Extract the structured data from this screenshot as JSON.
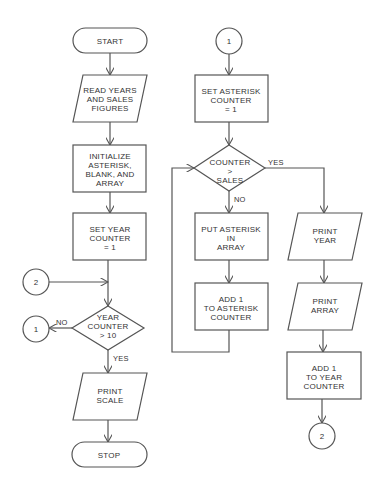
{
  "diagram": {
    "type": "flowchart",
    "colors": {
      "stroke": "#555555",
      "text": "#333333",
      "background": "#ffffff"
    },
    "nodes": {
      "start": {
        "shape": "terminal",
        "lines": [
          "START"
        ]
      },
      "read": {
        "shape": "input-output",
        "lines": [
          "READ YEARS",
          "AND SALES",
          "FIGURES"
        ]
      },
      "init": {
        "shape": "process",
        "lines": [
          "INITIALIZE",
          "ASTERISK,",
          "BLANK, AND",
          "ARRAY"
        ]
      },
      "set_year": {
        "shape": "process",
        "lines": [
          "SET YEAR",
          "COUNTER",
          "= 1"
        ]
      },
      "conn2_in": {
        "shape": "connector",
        "label": "2"
      },
      "year_decision": {
        "shape": "decision",
        "lines": [
          "YEAR",
          "COUNTER",
          "> 10"
        ]
      },
      "conn1_out": {
        "shape": "connector",
        "label": "1"
      },
      "print_scale": {
        "shape": "input-output",
        "lines": [
          "PRINT",
          "SCALE"
        ]
      },
      "stop": {
        "shape": "terminal",
        "lines": [
          "STOP"
        ]
      },
      "conn1_in": {
        "shape": "connector",
        "label": "1"
      },
      "set_asterisk": {
        "shape": "process",
        "lines": [
          "SET ASTERISK",
          "COUNTER",
          "= 1"
        ]
      },
      "counter_decision": {
        "shape": "decision",
        "lines": [
          "COUNTER",
          ">",
          "SALES"
        ]
      },
      "put_asterisk": {
        "shape": "process",
        "lines": [
          "PUT ASTERISK",
          "IN",
          "ARRAY"
        ]
      },
      "add_asterisk": {
        "shape": "process",
        "lines": [
          "ADD 1",
          "TO ASTERISK",
          "COUNTER"
        ]
      },
      "print_year": {
        "shape": "input-output",
        "lines": [
          "PRINT",
          "YEAR"
        ]
      },
      "print_array": {
        "shape": "input-output",
        "lines": [
          "PRINT",
          "ARRAY"
        ]
      },
      "add_year": {
        "shape": "process",
        "lines": [
          "ADD 1",
          "TO YEAR",
          "COUNTER"
        ]
      },
      "conn2_out": {
        "shape": "connector",
        "label": "2"
      }
    },
    "edge_labels": {
      "year_no": "NO",
      "year_yes": "YES",
      "counter_yes": "YES",
      "counter_no": "NO"
    },
    "edges": [
      [
        "start",
        "read"
      ],
      [
        "read",
        "init"
      ],
      [
        "init",
        "set_year"
      ],
      [
        "set_year",
        "year_decision"
      ],
      [
        "conn2_in",
        "year_decision"
      ],
      [
        "year_decision",
        "conn1_out",
        "NO"
      ],
      [
        "year_decision",
        "print_scale",
        "YES"
      ],
      [
        "print_scale",
        "stop"
      ],
      [
        "conn1_in",
        "set_asterisk"
      ],
      [
        "set_asterisk",
        "counter_decision"
      ],
      [
        "counter_decision",
        "put_asterisk",
        "NO"
      ],
      [
        "counter_decision",
        "print_year",
        "YES"
      ],
      [
        "put_asterisk",
        "add_asterisk"
      ],
      [
        "add_asterisk",
        "counter_decision"
      ],
      [
        "print_year",
        "print_array"
      ],
      [
        "print_array",
        "add_year"
      ],
      [
        "add_year",
        "conn2_out"
      ]
    ]
  }
}
